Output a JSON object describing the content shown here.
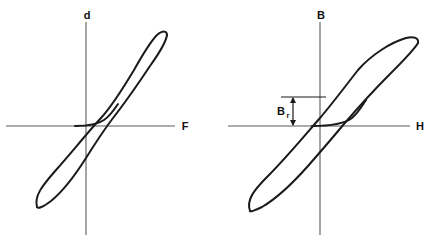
{
  "figure": {
    "background_color": "#ffffff",
    "curve_color": "#1a1a1a",
    "axis_color": "#5a5a5a",
    "label_color": "#111111"
  },
  "panels": [
    {
      "id": "left-panel",
      "name": "mechanical-hysteresis",
      "y_axis_label": "d",
      "x_axis_label": "F",
      "origin": {
        "x": 86,
        "y": 126
      },
      "annotations": []
    },
    {
      "id": "right-panel",
      "name": "magnetic-hysteresis",
      "y_axis_label": "B",
      "x_axis_label": "H",
      "origin": {
        "x": 320,
        "y": 126
      },
      "annotations": [
        {
          "name": "remanence-dimension",
          "label_main": "B",
          "label_sub": "r",
          "from_y": 97,
          "to_y": 126,
          "line_x_start": 281,
          "line_x_end": 320
        }
      ]
    }
  ],
  "chart_data": {
    "type": "line",
    "subplots": [
      {
        "name": "displacement-vs-force",
        "xlabel": "F",
        "ylabel": "d",
        "description": "Mechanical hysteresis loop: displacement d versus force F, counter-clockwise closed loop with pinched centre.",
        "grid": false,
        "legend": "none",
        "saturation_tip_upper": {
          "x": 157,
          "y": 35
        },
        "saturation_tip_lower": {
          "x": 37,
          "y": 207
        },
        "y_intercept_upper": 120,
        "y_intercept_lower": 132,
        "x_intercept_right": 110,
        "x_intercept_left": 64,
        "upper_branch": "M 37 207 C 34 196 42 186 56 170 C 72 152 88 132 101 118 C 112 106 122 90 134 70 C 143 54 150 42 157 35 C 163 30 167 31 167 35",
        "lower_branch": "M 167 35 C 166 42 160 52 150 66 C 138 84 124 104 113 118 C 104 130 96 142 86 158 C 74 177 62 192 51 201 C 43 207 38 209 37 207",
        "inner_pinch": "M 75 126 C 88 126 97 125 104 120 C 110 116 114 110 118 104"
      },
      {
        "name": "flux-density-vs-field",
        "xlabel": "H",
        "ylabel": "B",
        "description": "Magnetic hysteresis loop: flux density B versus field strength H, with remanence Br marked on the B axis.",
        "grid": false,
        "legend": "none",
        "saturation_tip_upper": {
          "x": 412,
          "y": 40
        },
        "saturation_tip_lower": {
          "x": 250,
          "y": 211
        },
        "remanence_label": "Br",
        "remanence_y": 97,
        "y_intercept_upper": 97,
        "y_intercept_lower": 126,
        "x_intercept_right": 350,
        "x_intercept_left": 292,
        "upper_branch": "M 250 211 C 246 200 254 190 268 176 C 286 158 306 134 320 118 C 332 104 344 88 358 70 C 372 54 392 42 406 38 C 414 36 419 38 418 43",
        "lower_branch": "M 418 43 C 414 50 404 60 390 74 C 374 90 356 110 344 124 C 334 136 322 150 308 166 C 292 184 274 200 262 207 C 254 211 250 212 250 211",
        "inner_pinch": "M 312 126 C 330 126 344 124 352 118 C 358 113 362 106 366 100"
      }
    ]
  }
}
